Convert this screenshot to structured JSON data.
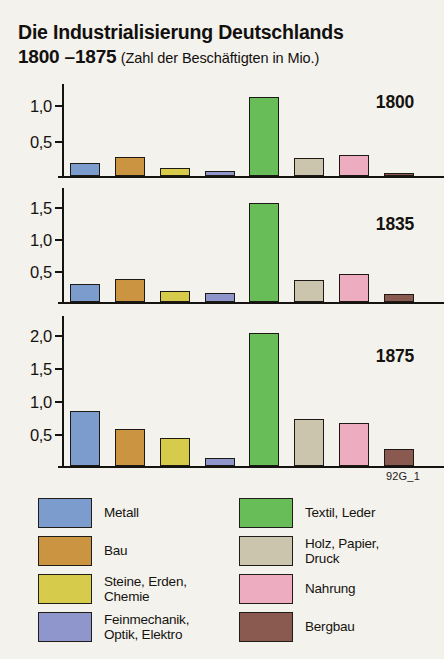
{
  "heading": {
    "line1": "Die Industrialisierung Deutschlands",
    "years": "1800 –1875",
    "subtitle": "(Zahl der Beschäftigten in Mio.)"
  },
  "source_code": "92G_1",
  "colors": {
    "metall": "#7b9ccc",
    "bau": "#ca9440",
    "steine": "#d6cb4a",
    "feinmechanik": "#8e96cc",
    "textil": "#69bd59",
    "holz": "#cbc5ad",
    "nahrung": "#eeacc0",
    "bergbau": "#8a5a50",
    "ink": "#15130f",
    "background": "#f4f2ed"
  },
  "legend": {
    "left": [
      {
        "label": "Metall",
        "color_key": "metall"
      },
      {
        "label": "Bau",
        "color_key": "bau"
      },
      {
        "label": "Steine, Erden,\nChemie",
        "color_key": "steine"
      },
      {
        "label": "Feinmechanik,\nOptik, Elektro",
        "color_key": "feinmechanik"
      }
    ],
    "right": [
      {
        "label": "Textil, Leder",
        "color_key": "textil"
      },
      {
        "label": "Holz, Papier,\nDruck",
        "color_key": "holz"
      },
      {
        "label": "Nahrung",
        "color_key": "nahrung"
      },
      {
        "label": "Bergbau",
        "color_key": "bergbau"
      }
    ]
  },
  "chart_data": {
    "type": "bar",
    "title": "Die Industrialisierung Deutschlands 1800 –1875",
    "subtitle": "(Zahl der Beschäftigten in Mio.)",
    "xlabel": "",
    "ylabel": "Zahl der Beschäftigten in Mio.",
    "grid": false,
    "legend_position": "bottom",
    "categories": [
      "Metall",
      "Bau",
      "Steine, Erden, Chemie",
      "Feinmechanik, Optik, Elektro",
      "Textil, Leder",
      "Holz, Papier, Druck",
      "Nahrung",
      "Bergbau"
    ],
    "category_colors": [
      "#7b9ccc",
      "#ca9440",
      "#d6cb4a",
      "#8e96cc",
      "#69bd59",
      "#cbc5ad",
      "#eeacc0",
      "#8a5a50"
    ],
    "panels": [
      {
        "year": "1800",
        "ylim": [
          0,
          1.28
        ],
        "yticks": [
          0.5,
          1.0
        ],
        "ytick_labels": [
          "0,5",
          "1,0"
        ],
        "values": [
          0.18,
          0.27,
          0.11,
          0.07,
          1.12,
          0.25,
          0.3,
          0.04
        ]
      },
      {
        "year": "1835",
        "ylim": [
          0,
          1.78
        ],
        "yticks": [
          0.5,
          1.0,
          1.5
        ],
        "ytick_labels": [
          "0,5",
          "1,0",
          "1,5"
        ],
        "values": [
          0.28,
          0.36,
          0.17,
          0.14,
          1.58,
          0.35,
          0.45,
          0.12
        ]
      },
      {
        "year": "1875",
        "ylim": [
          0,
          2.28
        ],
        "yticks": [
          0.5,
          1.0,
          1.5,
          2.0
        ],
        "ytick_labels": [
          "0,5",
          "1,0",
          "1,5",
          "2,0"
        ],
        "values": [
          0.85,
          0.57,
          0.43,
          0.13,
          2.05,
          0.72,
          0.66,
          0.26
        ]
      }
    ]
  }
}
